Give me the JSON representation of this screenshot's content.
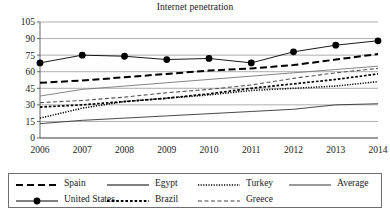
{
  "chart_data": {
    "type": "line",
    "title": "Internet penetration",
    "xlabel": "",
    "ylabel": "",
    "x": [
      2006,
      2007,
      2008,
      2009,
      2010,
      2011,
      2012,
      2013,
      2014
    ],
    "categories": [
      "2006",
      "2007",
      "2008",
      "2009",
      "2010",
      "2011",
      "2012",
      "2013",
      "2014"
    ],
    "ylim": [
      0,
      105
    ],
    "yticks": [
      0,
      15,
      30,
      45,
      60,
      75,
      90,
      105
    ],
    "ytick_labels": [
      "0",
      "15",
      "30",
      "45",
      "60",
      "75",
      "90",
      "105"
    ],
    "grid": true,
    "grid_axis": "y",
    "legend_position": "below",
    "series": [
      {
        "name": "Spain",
        "style": "dashed",
        "marker": "none",
        "color": "#000000",
        "values": [
          50,
          52,
          55,
          58,
          61,
          63,
          66,
          71,
          76
        ]
      },
      {
        "name": "United States",
        "style": "solid",
        "marker": "circle",
        "color": "#000000",
        "values": [
          68,
          75,
          74,
          71,
          72,
          68,
          78,
          84,
          88
        ]
      },
      {
        "name": "Egypt",
        "style": "solid",
        "marker": "none",
        "color": "#333333",
        "values": [
          13,
          16,
          18,
          20,
          22,
          24,
          26,
          30,
          31
        ]
      },
      {
        "name": "Brazil",
        "style": "dotted-dash",
        "marker": "none",
        "color": "#000000",
        "values": [
          28,
          30,
          33,
          36,
          40,
          45,
          49,
          53,
          58
        ]
      },
      {
        "name": "Turkey",
        "style": "dotted",
        "marker": "none",
        "color": "#000000",
        "values": [
          18,
          27,
          33,
          36,
          39,
          43,
          45,
          47,
          51
        ]
      },
      {
        "name": "Greece",
        "style": "dashed-short",
        "marker": "none",
        "color": "#555555",
        "values": [
          32,
          34,
          37,
          41,
          44,
          48,
          54,
          59,
          63
        ]
      },
      {
        "name": "Average",
        "style": "solid",
        "marker": "none",
        "color": "#777777",
        "values": [
          38,
          44,
          47,
          50,
          53,
          56,
          59,
          62,
          65
        ]
      }
    ]
  },
  "legend": {
    "rows": [
      [
        {
          "label": "Spain",
          "swatch": "dashed-swatch"
        },
        {
          "label": "Egypt",
          "swatch": "solid-swatch"
        },
        {
          "label": "Turkey",
          "swatch": "dotted-swatch"
        },
        {
          "label": "Average",
          "swatch": "solid-gray-swatch"
        }
      ],
      [
        {
          "label": "United States",
          "swatch": "solid-marker-swatch"
        },
        {
          "label": "Brazil",
          "swatch": "dotted-dash-swatch"
        },
        {
          "label": "Greece",
          "swatch": "dashed-short-swatch"
        }
      ]
    ]
  },
  "colors": {
    "axis": "#555555",
    "grid": "#888888",
    "text": "#1a1a1a",
    "legend_border": "#6e6e6e"
  }
}
